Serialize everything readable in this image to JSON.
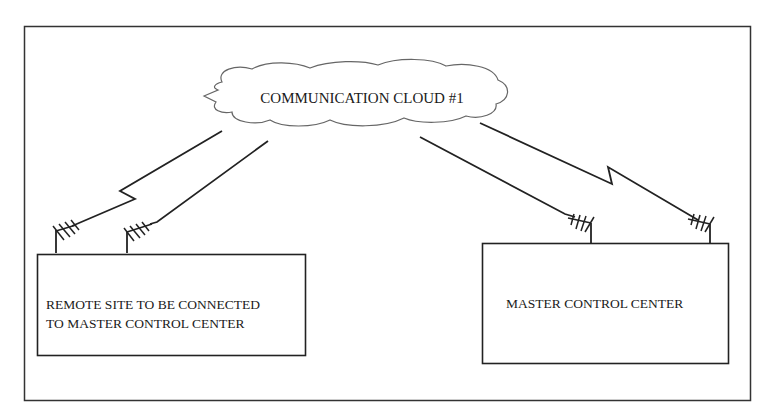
{
  "diagram": {
    "cloud": {
      "label": "COMMUNICATION CLOUD #1"
    },
    "remote_site": {
      "label_line1": "REMOTE SITE TO BE CONNECTED",
      "label_line2": "TO MASTER CONTROL CENTER"
    },
    "master_center": {
      "label": "MASTER CONTROL CENTER"
    },
    "colors": {
      "stroke": "#222222",
      "cloud_stroke": "#666666",
      "background": "#ffffff"
    }
  }
}
